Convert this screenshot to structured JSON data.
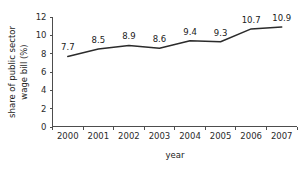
{
  "chart_data": {
    "type": "line",
    "title": "",
    "subtitle": "",
    "xlabel": "year",
    "ylabel": "share of public sector\nwage bill (%)",
    "ylabel_line1": "share of public sector",
    "ylabel_line2": "wage bill (%)",
    "categories": [
      "2000",
      "2001",
      "2002",
      "2003",
      "2004",
      "2005",
      "2006",
      "2007"
    ],
    "values": [
      7.7,
      8.5,
      8.9,
      8.6,
      9.4,
      9.3,
      10.7,
      10.9
    ],
    "point_labels": [
      "7.7",
      "8.5",
      "8.9",
      "8.6",
      "9.4",
      "9.3",
      "10.7",
      "10.9"
    ],
    "ylim": [
      0,
      12
    ],
    "yticks": [
      0,
      2,
      4,
      6,
      8,
      10,
      12
    ],
    "ytick_labels": [
      "0",
      "2",
      "4",
      "6",
      "8",
      "10",
      "12"
    ],
    "xtick_labels": [
      "2000",
      "2001",
      "2002",
      "2003",
      "2004",
      "2005",
      "2006",
      "2007"
    ],
    "grid": false,
    "legend": false,
    "legend_position": "none",
    "series": [
      {
        "name": "share of public sector wage bill (%)",
        "values": [
          7.7,
          8.5,
          8.9,
          8.6,
          9.4,
          9.3,
          10.7,
          10.9
        ],
        "color": "#2b2b2b"
      }
    ],
    "colors": {
      "line": "#2b2b2b",
      "axis": "#4d4d4d",
      "text": "#1a1a1a",
      "background": "#ffffff"
    }
  }
}
